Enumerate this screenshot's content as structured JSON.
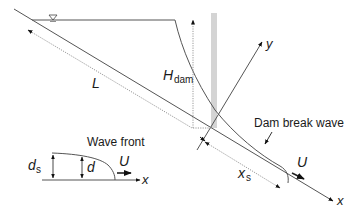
{
  "diagram": {
    "labels": {
      "L": "L",
      "H": "H",
      "H_sub": "dam",
      "y_axis": "y",
      "x_axis": "x",
      "dam_break_wave": "Dam break wave",
      "U_main": "U",
      "x": "x",
      "x_sub": "s",
      "wave_front": "Wave front",
      "d": "d",
      "d_s": "d",
      "d_s_sub": "s",
      "U_inset": "U",
      "x_inset": "x"
    },
    "icons": {
      "water_surface_marker": "inverted-triangle-free-surface-symbol"
    },
    "colors": {
      "line": "#555555",
      "dotted": "#8a8a8a",
      "dam": "#d4d4d4",
      "text": "#1a1a1a"
    }
  }
}
